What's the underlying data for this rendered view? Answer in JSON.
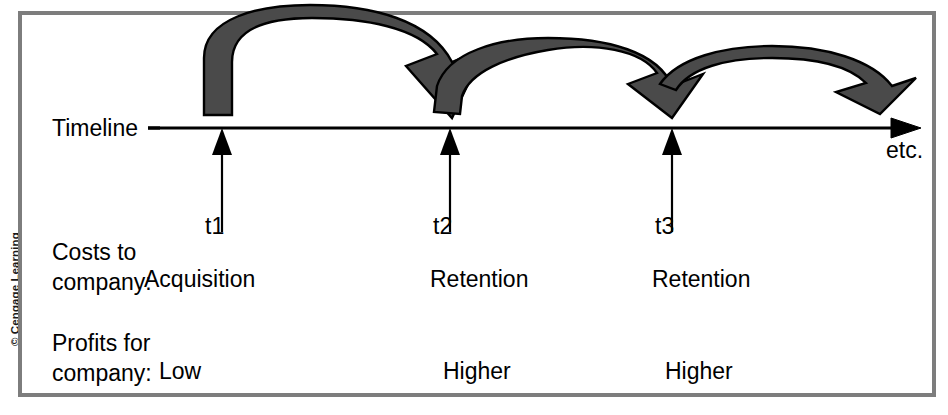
{
  "figure": {
    "credit": "© Cengage Learning",
    "timeline_label": "Timeline",
    "etc_label": "etc.",
    "colors": {
      "arc_fill": "#4a4a4a",
      "arc_stroke": "#000000",
      "frame": "#7d7d7d",
      "axis": "#000000",
      "text": "#000000",
      "background": "#ffffff"
    }
  },
  "timeline": {
    "ticks": [
      {
        "id": "t1",
        "label": "t1"
      },
      {
        "id": "t2",
        "label": "t2"
      },
      {
        "id": "t3",
        "label": "t3"
      }
    ]
  },
  "rows": [
    {
      "id": "costs",
      "head_line1": "Costs to",
      "head_line2": "company:",
      "cells": [
        "Acquisition",
        "Retention",
        "Retention"
      ]
    },
    {
      "id": "profits",
      "head_line1": "Profits for",
      "head_line2": "company:",
      "cells": [
        "Low",
        "Higher",
        "Higher"
      ]
    }
  ],
  "arcs": [
    {
      "id": "arc-t1-t2",
      "from": "t1",
      "to": "t2",
      "head": "down"
    },
    {
      "id": "arc-t2-t3",
      "from": "t2",
      "to": "t3",
      "head": "down"
    },
    {
      "id": "arc-t3-etc",
      "from": "t3",
      "to": "etc",
      "head": "right"
    }
  ]
}
